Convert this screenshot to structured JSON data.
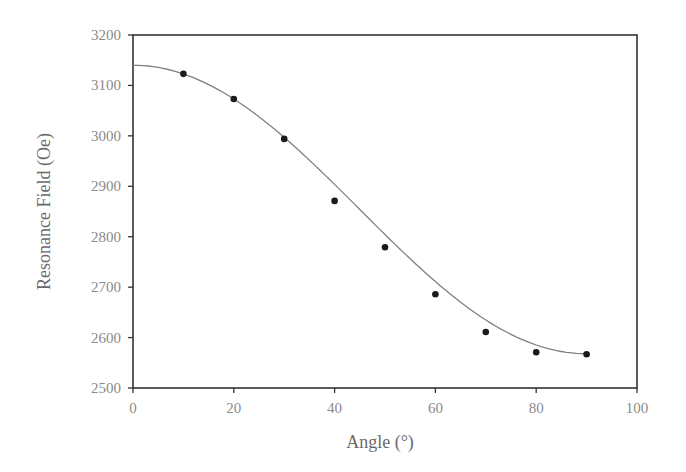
{
  "chart_data": {
    "type": "scatter",
    "title": "",
    "xlabel": "Angle (°)",
    "ylabel": "Resonance Field (Oe)",
    "xlim": [
      0,
      100
    ],
    "ylim": [
      2500,
      3200
    ],
    "xticks": [
      0,
      20,
      40,
      60,
      80,
      100
    ],
    "yticks": [
      2500,
      2600,
      2700,
      2800,
      2900,
      3000,
      3100,
      3200
    ],
    "grid": false,
    "legend": null,
    "series": [
      {
        "name": "Measured",
        "kind": "scatter",
        "x": [
          10,
          20,
          30,
          40,
          50,
          60,
          70,
          80,
          90
        ],
        "y": [
          3123,
          3073,
          2994,
          2871,
          2779,
          2686,
          2611,
          2571,
          2567
        ]
      },
      {
        "name": "Fit",
        "kind": "line",
        "x": [
          0,
          10,
          20,
          30,
          40,
          50,
          60,
          70,
          80,
          90
        ],
        "y": [
          3140,
          3123,
          3068,
          2982,
          2885,
          2785,
          2690,
          2620,
          2580,
          2568
        ]
      }
    ]
  },
  "colors": {
    "axis": "#333333",
    "points": "#1a1a1a",
    "fit_line": "#808080",
    "labels": "#8a8a8a"
  }
}
